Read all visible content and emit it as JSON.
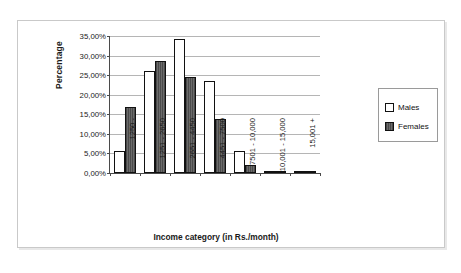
{
  "chart_data": {
    "type": "bar",
    "title": "",
    "xlabel": "Income category (in Rs./month)",
    "ylabel": "Percentage",
    "ylim": [
      0,
      35
    ],
    "ytick_labels": [
      "0,00%",
      "5,00%",
      "10,00%",
      "15,00%",
      "20,00%",
      "25,00%",
      "30,00%",
      "35,00%"
    ],
    "ytick_values": [
      0,
      5,
      10,
      15,
      20,
      25,
      30,
      35
    ],
    "grid": true,
    "legend_position": "right",
    "categories": [
      "1250 -",
      "1251 - 2650",
      "2651 - 4450",
      "4451 - 7500",
      "7501 - 10,000",
      "10,001 - 15,000",
      "15,001 +"
    ],
    "series": [
      {
        "name": "Males",
        "values": [
          5.7,
          26.0,
          34.2,
          23.5,
          5.5,
          0.5,
          0.1
        ]
      },
      {
        "name": "Females",
        "values": [
          16.8,
          28.5,
          24.6,
          13.9,
          2.0,
          0.4,
          0.1
        ]
      }
    ]
  },
  "legend": {
    "items": [
      {
        "label": "Males"
      },
      {
        "label": "Females"
      }
    ]
  }
}
